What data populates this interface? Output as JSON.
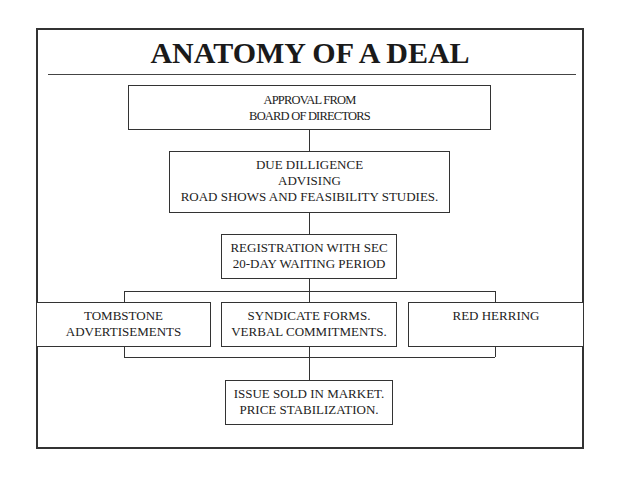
{
  "title": "ANATOMY OF A DEAL",
  "boxes": {
    "approval": {
      "line1": "APPROVAL FROM",
      "line2": "BOARD OF DIRECTORS"
    },
    "diligence": {
      "line1": "DUE DILLIGENCE",
      "line2": "ADVISING",
      "line3": "ROAD SHOWS AND FEASIBILITY STUDIES."
    },
    "registration": {
      "line1": "REGISTRATION WITH SEC",
      "line2": "20-DAY WAITING PERIOD"
    },
    "tombstone": {
      "line1": "TOMBSTONE",
      "line2": "ADVERTISEMENTS"
    },
    "syndicate": {
      "line1": "SYNDICATE FORMS.",
      "line2": "VERBAL COMMITMENTS."
    },
    "red_herring": {
      "line1": "RED HERRING"
    },
    "issue": {
      "line1": "ISSUE SOLD IN MARKET.",
      "line2": "PRICE STABILIZATION."
    }
  }
}
